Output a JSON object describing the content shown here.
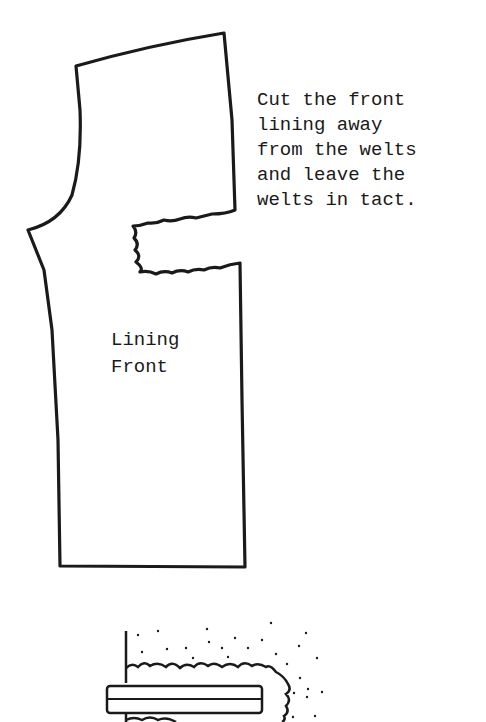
{
  "instruction": {
    "lines": [
      "Cut the front",
      "lining away",
      "from the welts",
      "and leave the",
      "welts in tact."
    ]
  },
  "pattern_piece": {
    "label_lines": [
      "Lining",
      "Front"
    ]
  },
  "colors": {
    "ink": "#1a1a1a",
    "background": "#ffffff"
  }
}
